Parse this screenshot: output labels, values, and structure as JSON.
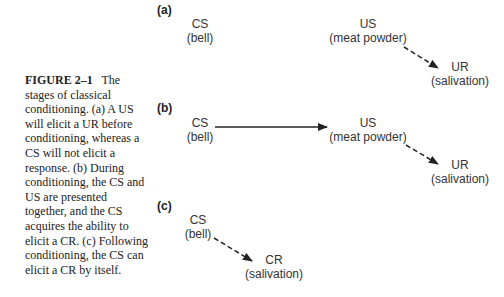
{
  "caption": {
    "figure_label": "FIGURE 2–1",
    "text": "The stages of classical conditioning. (a) A US will elicit a UR before conditioning, whereas a CS will not elicit a response. (b) During conditioning, the CS and US are presented together, and the CS acquires the ability to elicit a CR. (c) Following conditioning, the CS can elicit a CR by itself."
  },
  "panels": [
    {
      "label": "(a)",
      "nodes": [
        {
          "title": "CS",
          "sub": "(bell)"
        },
        {
          "title": "US",
          "sub": "(meat powder)"
        },
        {
          "title": "UR",
          "sub": "(salivation)"
        }
      ],
      "edges": [
        {
          "from": "US",
          "to": "UR",
          "style": "dashed"
        }
      ]
    },
    {
      "label": "(b)",
      "nodes": [
        {
          "title": "CS",
          "sub": "(bell)"
        },
        {
          "title": "US",
          "sub": "(meat powder)"
        },
        {
          "title": "UR",
          "sub": "(salivation)"
        }
      ],
      "edges": [
        {
          "from": "CS",
          "to": "US",
          "style": "solid"
        },
        {
          "from": "US",
          "to": "UR",
          "style": "dashed"
        }
      ]
    },
    {
      "label": "(c)",
      "nodes": [
        {
          "title": "CS",
          "sub": "(bell)"
        },
        {
          "title": "CR",
          "sub": "(salivation)"
        }
      ],
      "edges": [
        {
          "from": "CS",
          "to": "CR",
          "style": "dashed"
        }
      ]
    }
  ]
}
